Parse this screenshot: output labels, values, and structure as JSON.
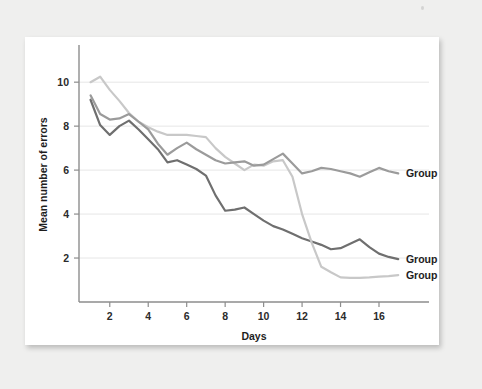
{
  "figure": {
    "background_color": "#efefee",
    "card_color": "#ffffff"
  },
  "chart_data": {
    "type": "line",
    "title": "",
    "subtitle": "",
    "xlabel": "Days",
    "ylabel": "Mean number of errors",
    "xlim": [
      0.4,
      18.6
    ],
    "ylim": [
      0,
      11.6
    ],
    "xticks": [
      2,
      4,
      6,
      8,
      10,
      12,
      14,
      16
    ],
    "yticks": [
      2,
      4,
      6,
      8,
      10
    ],
    "xtick_labels": [
      "2",
      "4",
      "6",
      "8",
      "10",
      "12",
      "14",
      "16"
    ],
    "ytick_labels": [
      "2",
      "4",
      "6",
      "8",
      "10"
    ],
    "grid": "horizontal",
    "grid_color": "#e6e6e6",
    "legend_position": "inline-right-of-line-end",
    "x": [
      1,
      1.5,
      2,
      2.5,
      3,
      3.5,
      4,
      4.5,
      5,
      5.5,
      6,
      6.5,
      7,
      7.5,
      8,
      8.5,
      9,
      9.5,
      10,
      10.5,
      11,
      11.5,
      12,
      12.5,
      13,
      13.5,
      14,
      14.5,
      15,
      15.5,
      16,
      16.5,
      17
    ],
    "series": [
      {
        "name": "Group 1",
        "label": "Group 1",
        "color": "#6f6f6f",
        "label_x": 17.4,
        "label_y": 1.95,
        "values": [
          9.2,
          8.05,
          7.6,
          8.0,
          8.25,
          7.85,
          7.4,
          6.95,
          6.35,
          6.45,
          6.25,
          6.05,
          5.75,
          4.85,
          4.15,
          4.2,
          4.3,
          4.0,
          3.7,
          3.45,
          3.3,
          3.1,
          2.9,
          2.75,
          2.6,
          2.4,
          2.45,
          2.65,
          2.85,
          2.5,
          2.2,
          2.05,
          1.95
        ]
      },
      {
        "name": "Group 2",
        "label": "Group 2",
        "color": "#c8c8c8",
        "label_x": 17.4,
        "label_y": 1.2,
        "values": [
          10.0,
          10.25,
          9.65,
          9.15,
          8.6,
          8.2,
          7.95,
          7.75,
          7.6,
          7.6,
          7.6,
          7.55,
          7.5,
          7.0,
          6.6,
          6.3,
          6.0,
          6.25,
          6.2,
          6.4,
          6.45,
          5.7,
          4.0,
          2.7,
          1.6,
          1.35,
          1.12,
          1.1,
          1.1,
          1.12,
          1.15,
          1.18,
          1.22
        ]
      },
      {
        "name": "Group 3",
        "label": "Group 3",
        "color": "#9b9b9b",
        "label_x": 17.4,
        "label_y": 5.85,
        "values": [
          9.4,
          8.55,
          8.3,
          8.35,
          8.55,
          8.2,
          7.85,
          7.2,
          6.7,
          7.0,
          7.25,
          6.95,
          6.7,
          6.45,
          6.3,
          6.35,
          6.4,
          6.2,
          6.25,
          6.5,
          6.75,
          6.3,
          5.85,
          5.95,
          6.1,
          6.05,
          5.95,
          5.85,
          5.7,
          5.9,
          6.1,
          5.95,
          5.85
        ]
      }
    ]
  }
}
